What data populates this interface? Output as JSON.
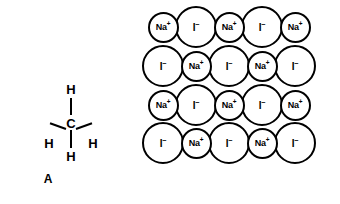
{
  "figure": {
    "panels": [
      {
        "id": "A",
        "caption": "A",
        "kind": "lewis-structure",
        "molecule": "CH4",
        "center_atom": "C",
        "atoms": [
          {
            "symbol": "H",
            "position": "top"
          },
          {
            "symbol": "C",
            "position": "center"
          },
          {
            "symbol": "H",
            "position": "left"
          },
          {
            "symbol": "H",
            "position": "right"
          },
          {
            "symbol": "H",
            "position": "bottom"
          }
        ],
        "bond_count": 4
      },
      {
        "id": "B",
        "caption": "B",
        "kind": "ionic-lattice",
        "compound": "NaI",
        "rows": 4,
        "columns": 5,
        "cation": {
          "symbol": "Na",
          "charge": "+",
          "relative_size": "small"
        },
        "anion": {
          "symbol": "I",
          "charge": "−",
          "relative_size": "large"
        },
        "grid": [
          [
            "Na+",
            "I-",
            "Na+",
            "I-",
            "Na+"
          ],
          [
            "I-",
            "Na+",
            "I-",
            "Na+",
            "I-"
          ],
          [
            "Na+",
            "I-",
            "Na+",
            "I-",
            "Na+"
          ],
          [
            "I-",
            "Na+",
            "I-",
            "Na+",
            "I-"
          ]
        ],
        "ion_text": {
          "cation_symbol": "Na",
          "cation_charge": "+",
          "anion_symbol": "I",
          "anion_charge": "−"
        }
      }
    ]
  },
  "colors": {
    "ink": "#000000",
    "background": "#ffffff"
  }
}
